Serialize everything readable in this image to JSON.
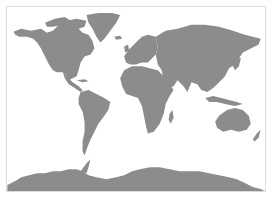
{
  "map": {
    "type": "world-political-outline",
    "projection": "equirectangular-like",
    "colors": {
      "land": "#8c8c8c",
      "ocean": "#ffffff",
      "frame": "#dcdcdc"
    },
    "regions": [
      {
        "name": "North America"
      },
      {
        "name": "Greenland"
      },
      {
        "name": "South America"
      },
      {
        "name": "Europe"
      },
      {
        "name": "Africa"
      },
      {
        "name": "Asia"
      },
      {
        "name": "Australia"
      },
      {
        "name": "New Zealand"
      },
      {
        "name": "Antarctica"
      }
    ]
  }
}
